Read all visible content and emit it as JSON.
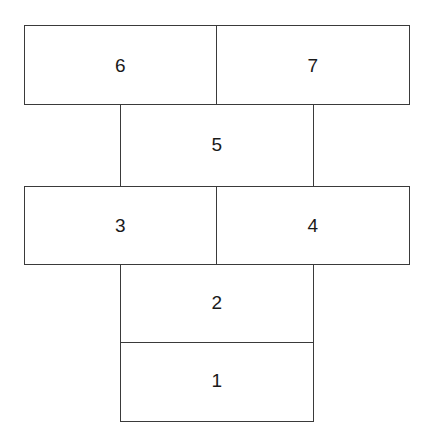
{
  "diagram": {
    "type": "stacked-block-diagram",
    "background_color": "#ffffff",
    "line_color": "#3a3a3a",
    "text_color": "#1a1a1a",
    "blocks": [
      {
        "id": "block-6",
        "label": "6",
        "row": "top",
        "column": "left"
      },
      {
        "id": "block-7",
        "label": "7",
        "row": "top",
        "column": "right"
      },
      {
        "id": "block-5",
        "label": "5",
        "row": "upper-middle",
        "column": "center"
      },
      {
        "id": "block-3",
        "label": "3",
        "row": "middle",
        "column": "left"
      },
      {
        "id": "block-4",
        "label": "4",
        "row": "middle",
        "column": "right"
      },
      {
        "id": "block-2",
        "label": "2",
        "row": "lower",
        "column": "center"
      },
      {
        "id": "block-1",
        "label": "1",
        "row": "bottom",
        "column": "center"
      }
    ]
  }
}
